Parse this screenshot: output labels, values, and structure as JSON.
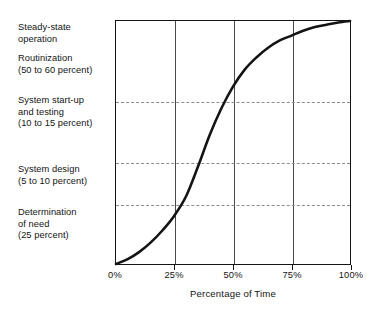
{
  "stage_labels": [
    {
      "id": "steady-state-operation",
      "text": "Steady-state\noperation",
      "left": 18,
      "top": 22
    },
    {
      "id": "routinization",
      "text": "Routinization\n(50 to 60 percent)",
      "left": 18,
      "top": 53
    },
    {
      "id": "system-start-up-and-testing",
      "text": "System start-up\nand testing\n(10 to 15 percent)",
      "left": 18,
      "top": 95
    },
    {
      "id": "system-design",
      "text": "System design\n(5 to 10 percent)",
      "left": 18,
      "top": 164
    },
    {
      "id": "determination-of-need",
      "text": "Determination\nof need\n(25 percent)",
      "left": 18,
      "top": 207
    }
  ],
  "bottom_caption": "",
  "chart_data": {
    "type": "line",
    "title": "",
    "subtitle": "",
    "xlabel": "Percentage of Time",
    "ylabel": "",
    "xlim": [
      0,
      100
    ],
    "ylim": [
      0,
      100
    ],
    "xticks": [
      0,
      25,
      50,
      75,
      100
    ],
    "xtick_labels": [
      "0%",
      "25%",
      "50%",
      "75%",
      "100%"
    ],
    "grid": {
      "vertical_at": [
        25,
        50,
        75
      ],
      "vertical_style": "solid",
      "horizontal_at": [
        25,
        42,
        67
      ],
      "horizontal_style": "dashed"
    },
    "legend": null,
    "series": [
      {
        "name": "Cumulative effort over system life cycle",
        "style": "solid",
        "color": "#141414",
        "x": [
          0,
          5,
          10,
          15,
          20,
          25,
          30,
          35,
          40,
          45,
          50,
          55,
          60,
          65,
          70,
          75,
          80,
          85,
          90,
          95,
          100
        ],
        "y": [
          0,
          2,
          5,
          9,
          14,
          20,
          28,
          40,
          53,
          64,
          73,
          80,
          85,
          89,
          92,
          94,
          96,
          97.5,
          98.5,
          99.4,
          100
        ]
      }
    ],
    "annotations": [
      {
        "label": "Determination of need (25 percent)",
        "band_y": [
          0,
          25
        ]
      },
      {
        "label": "System design (5 to 10 percent)",
        "band_y": [
          25,
          42
        ]
      },
      {
        "label": "System start-up and testing (10 to 15 percent)",
        "band_y": [
          42,
          67
        ]
      },
      {
        "label": "Routinization (50 to 60 percent)",
        "band_y": [
          67,
          100
        ]
      },
      {
        "label": "Steady-state operation",
        "band_y": [
          67,
          100
        ]
      }
    ]
  }
}
